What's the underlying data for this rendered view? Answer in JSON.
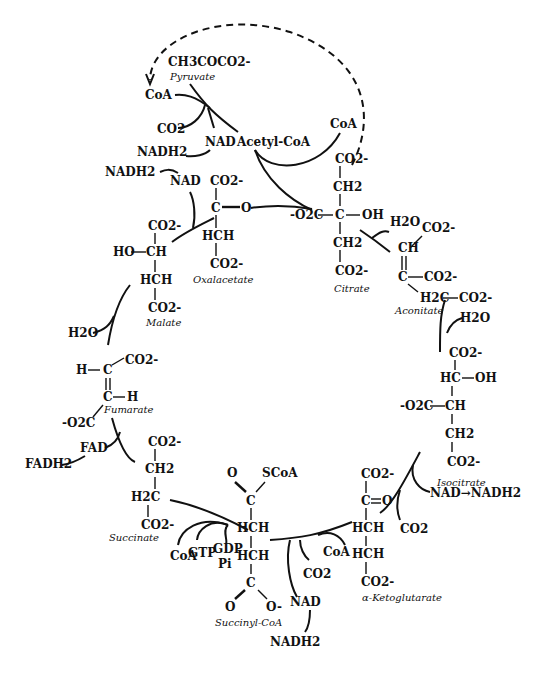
{
  "diagram": {
    "compounds": {
      "pyruvate": {
        "formula": "CH3COCO2-",
        "label": "Pyruvate"
      },
      "acetyl_coa": {
        "label": "Acetyl-CoA"
      },
      "oxalacetate": {
        "label": "Oxalacetate",
        "atoms": [
          "CO2-",
          "C",
          "O",
          "HCH",
          "CO2-"
        ]
      },
      "citrate": {
        "label": "Citrate",
        "atoms": [
          "CO2-",
          "CH2",
          "-O2C",
          "C",
          "OH",
          "CH2",
          "CO2-"
        ]
      },
      "aconitate": {
        "label": "Aconitate",
        "atoms": [
          "CO2-",
          "CH",
          "C",
          "CO2-",
          "H2C",
          "CO2-"
        ]
      },
      "isocitrate": {
        "label": "Isocitrate",
        "atoms": [
          "CO2-",
          "HC",
          "OH",
          "-O2C",
          "CH",
          "CH2",
          "CO2-"
        ]
      },
      "a_ketoglutarate": {
        "label": "α-Ketoglutarate",
        "atoms": [
          "CO2-",
          "C",
          "O",
          "HCH",
          "HCH",
          "CO2-"
        ]
      },
      "succinyl_coa": {
        "label": "Succinyl-CoA",
        "atoms": [
          "O",
          "SCoA",
          "C",
          "HCH",
          "HCH",
          "C",
          "O",
          "O-"
        ]
      },
      "succinate": {
        "label": "Succinate",
        "atoms": [
          "CO2-",
          "CH2",
          "H2C",
          "CO2-"
        ]
      },
      "fumarate": {
        "label": "Fumarate",
        "atoms": [
          "CO2-",
          "H",
          "C",
          "C",
          "H",
          "-O2C"
        ]
      },
      "malate": {
        "label": "Malate",
        "atoms": [
          "CO2-",
          "HO",
          "CH",
          "HCH",
          "CO2-"
        ]
      }
    },
    "cofactors": {
      "coa_top_left": "CoA",
      "co2_pyruvate": "CO2",
      "nad_pyruvate": "NAD",
      "nadh2_pyruvate": "NADH2",
      "coa_top_right": "CoA",
      "nadh2_malate": "NADH2",
      "nad_malate": "NAD",
      "h2o_aconitate": "H2O",
      "h2o_isocitrate": "H2O",
      "nad_nadh2_isocitrate": "NAD→NADH2",
      "co2_isocitrate": "CO2",
      "coa_ketoglutarate": "CoA",
      "co2_ketoglutarate": "CO2",
      "nad_ketoglutarate": "NAD",
      "nadh2_ketoglutarate": "NADH2",
      "coa_succinyl": "CoA",
      "gtp": "GTP",
      "gdp": "GDP",
      "pi": "Pi",
      "fad": "FAD",
      "fadh2": "FADH2",
      "h2o_fumarate": "H2O"
    }
  }
}
